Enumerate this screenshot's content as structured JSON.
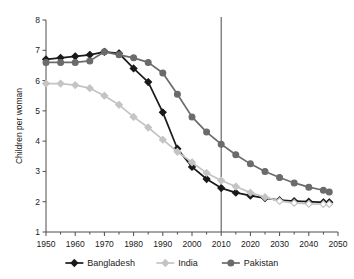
{
  "chart_data": {
    "type": "line",
    "title": "",
    "xlabel": "",
    "ylabel": "Children per woman",
    "xlim": [
      1950,
      2050
    ],
    "ylim": [
      1,
      8
    ],
    "grid": false,
    "legend_position": "bottom",
    "xticks": [
      "1950",
      "1960",
      "1970",
      "1980",
      "1990",
      "2000",
      "2010",
      "2020",
      "2030",
      "2040",
      "2050"
    ],
    "yticks": [
      "1",
      "2",
      "3",
      "4",
      "5",
      "6",
      "7",
      "8"
    ],
    "x": [
      1950,
      1955,
      1960,
      1965,
      1970,
      1975,
      1980,
      1985,
      1990,
      1995,
      2000,
      2005,
      2010,
      2015,
      2020,
      2025,
      2030,
      2035,
      2040,
      2045,
      2047
    ],
    "annotations": [
      {
        "name": "present-year-line",
        "type": "vertical-line",
        "x": 2010
      }
    ],
    "series": [
      {
        "name": "Bangladesh",
        "color": "#1a1a1a",
        "marker": "diamond",
        "values": [
          6.7,
          6.75,
          6.8,
          6.85,
          6.95,
          6.9,
          6.4,
          5.95,
          4.95,
          3.75,
          3.15,
          2.75,
          2.45,
          2.3,
          2.2,
          2.12,
          2.05,
          2.02,
          2.0,
          1.98,
          1.98
        ]
      },
      {
        "name": "India",
        "color": "#c4c4c4",
        "marker": "diamond",
        "values": [
          5.9,
          5.9,
          5.85,
          5.75,
          5.5,
          5.2,
          4.8,
          4.45,
          4.05,
          3.65,
          3.3,
          2.95,
          2.7,
          2.5,
          2.3,
          2.15,
          2.02,
          1.96,
          1.93,
          1.92,
          1.92
        ]
      },
      {
        "name": "Pakistan",
        "color": "#6b6b6b",
        "marker": "circle",
        "values": [
          6.6,
          6.6,
          6.6,
          6.65,
          6.95,
          6.85,
          6.75,
          6.6,
          6.25,
          5.55,
          4.8,
          4.3,
          3.9,
          3.55,
          3.25,
          3.0,
          2.8,
          2.62,
          2.48,
          2.38,
          2.32
        ]
      }
    ]
  },
  "legend": {
    "items": [
      {
        "label": "Bangladesh",
        "color": "#1a1a1a",
        "marker": "diamond"
      },
      {
        "label": "India",
        "color": "#c4c4c4",
        "marker": "diamond"
      },
      {
        "label": "Pakistan",
        "color": "#6b6b6b",
        "marker": "circle"
      }
    ]
  },
  "axes": {
    "y_title": "Children per woman"
  }
}
